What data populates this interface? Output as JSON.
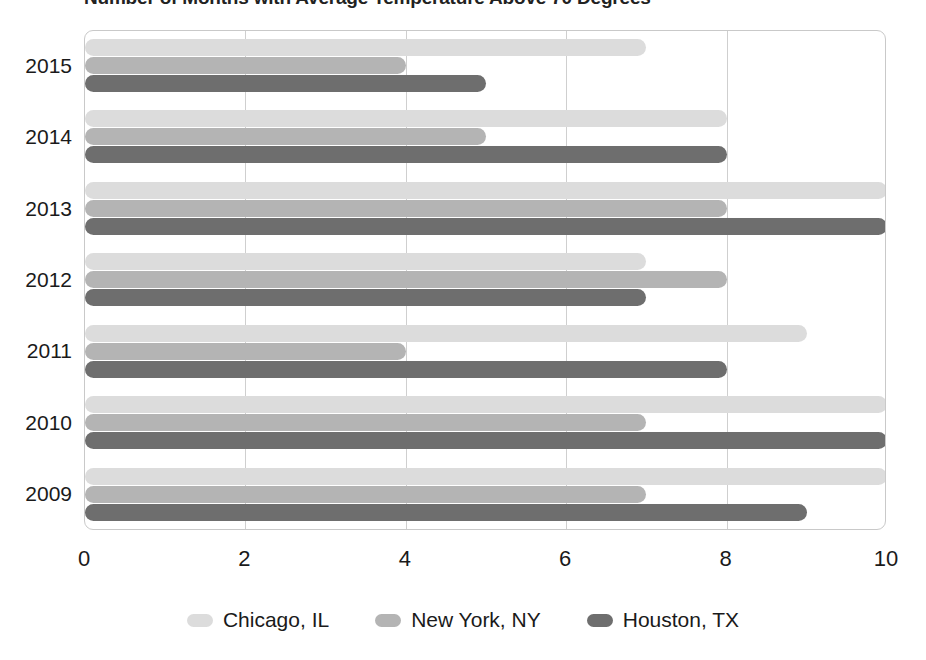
{
  "chart_data": {
    "type": "bar",
    "orientation": "horizontal",
    "title": "Number of Months with Average Temperature Above 70 Degrees",
    "xlabel": "",
    "ylabel": "",
    "categories": [
      "2015",
      "2014",
      "2013",
      "2012",
      "2011",
      "2010",
      "2009"
    ],
    "series": [
      {
        "name": "Chicago, IL",
        "color": "#dcdcdc",
        "values": [
          7,
          8,
          10,
          7,
          9,
          10,
          10
        ]
      },
      {
        "name": "New York, NY",
        "color": "#b4b4b4",
        "values": [
          4,
          5,
          8,
          8,
          4,
          7,
          7
        ]
      },
      {
        "name": "Houston, TX",
        "color": "#6e6e6e",
        "values": [
          5,
          8,
          10,
          7,
          8,
          10,
          9
        ]
      }
    ],
    "xticks": [
      "0",
      "2",
      "4",
      "6",
      "8",
      "10"
    ],
    "xtick_values": [
      0,
      2,
      4,
      6,
      8,
      10
    ],
    "xlim": [
      0,
      10
    ],
    "grid": true,
    "grid_axis": "x",
    "legend_position": "bottom"
  },
  "colors": {
    "chicago": "#dcdcdc",
    "new_york": "#b4b4b4",
    "houston": "#6e6e6e",
    "gridline": "#cfcfcf",
    "plot_border": "#c9c9c9",
    "text": "#1a1a1a",
    "background": "#ffffff"
  }
}
